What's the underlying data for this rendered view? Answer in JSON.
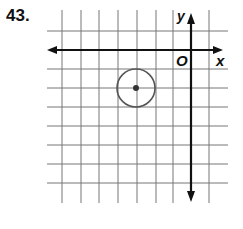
{
  "problem": {
    "number": "43."
  },
  "graph": {
    "x_axis_label": "x",
    "y_axis_label": "y",
    "origin_label": "O",
    "grid_unit": 1,
    "x_range": [
      -7,
      1
    ],
    "y_range": [
      -8,
      1
    ],
    "circle": {
      "center": [
        -3,
        -2
      ],
      "radius": 1,
      "color": "#555555"
    },
    "grid_color": "#666666",
    "axis_color": "#111111"
  }
}
